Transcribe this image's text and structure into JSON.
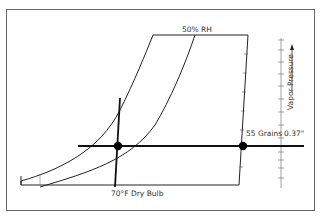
{
  "diagram": {
    "type": "psychrometric-chart",
    "labels": {
      "rh_curve": "50% RH",
      "dry_bulb": "70°F Dry Bulb",
      "grains": "55 Grains",
      "vapor_value": "0.37\"",
      "vapor_axis": "Vapor Pressure"
    },
    "colors": {
      "border": "#555555",
      "line": "#222222",
      "thick_line": "#111111",
      "text": "#333333",
      "dot": "#000000"
    },
    "points": [
      {
        "name": "state-point",
        "label": "70°F / 50% RH"
      },
      {
        "name": "saturation-grains-point",
        "label": "55 Grains"
      }
    ]
  }
}
